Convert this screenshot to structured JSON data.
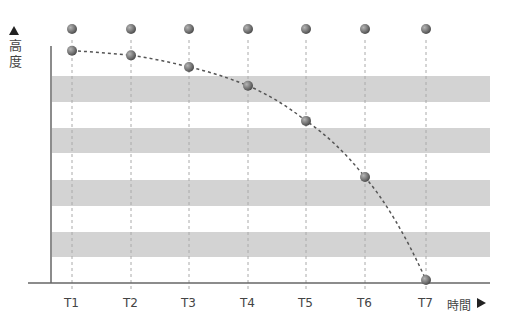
{
  "diagram": {
    "y_axis_label": "高度",
    "x_axis_label": "時間",
    "time_labels": [
      "T1",
      "T2",
      "T3",
      "T4",
      "T5",
      "T6",
      "T7"
    ],
    "colors": {
      "band": "#d3d3d3",
      "axis": "#666666",
      "ball": "#7a7a7a",
      "guide": "#aaaaaa",
      "curve": "#555555"
    }
  },
  "chart_data": {
    "type": "scatter",
    "title": "",
    "xlabel": "時間",
    "ylabel": "高度",
    "categories": [
      "T1",
      "T2",
      "T3",
      "T4",
      "T5",
      "T6",
      "T7"
    ],
    "series": [
      {
        "name": "reference (top row)",
        "values": [
          1.0,
          1.0,
          1.0,
          1.0,
          1.0,
          1.0,
          1.0
        ]
      },
      {
        "name": "falling object height",
        "values": [
          0.98,
          0.96,
          0.91,
          0.83,
          0.68,
          0.44,
          0.0
        ],
        "style": "dashed curve"
      }
    ],
    "horizontal_bands": 4,
    "grid": "vertical dashed guides at each T",
    "legend": "none"
  }
}
